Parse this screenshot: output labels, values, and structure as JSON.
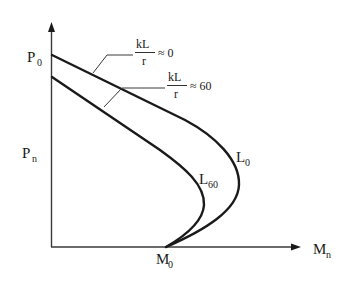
{
  "diagram": {
    "type": "column interaction diagram (slenderness effect)",
    "axes": {
      "y_label": "P",
      "y_label_sub": "n",
      "x_label": "M",
      "x_label_sub": "n"
    },
    "points": {
      "p0_main": "P",
      "p0_sub": "0",
      "m0_main": "M",
      "m0_sub": "0"
    },
    "curves": [
      {
        "id": "L0",
        "label_main": "L",
        "label_sub": "0",
        "annotation_num": "kL",
        "annotation_den": "r",
        "annotation_rel": "≈ 0"
      },
      {
        "id": "L60",
        "label_main": "L",
        "label_sub": "60",
        "annotation_num": "kL",
        "annotation_den": "r",
        "annotation_rel": "≈ 60"
      }
    ],
    "colors": {
      "line": "#1a1a1a",
      "axis": "#3a3a3a",
      "background": "#ffffff"
    }
  }
}
